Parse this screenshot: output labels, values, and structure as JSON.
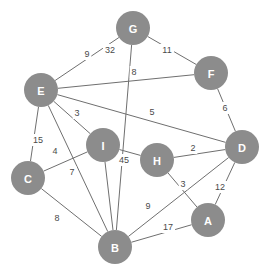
{
  "chart_data": {
    "type": "diagram",
    "subtype": "weighted-undirected-graph",
    "title": "",
    "xlabel": "",
    "ylabel": "",
    "node_radius": 17,
    "node_color": "#8c8c8c",
    "node_label_color": "#ffffff",
    "edge_color": "#6f6f6f",
    "edge_label_color": "#4a4a4a",
    "background": "#ffffff",
    "nodes": [
      {
        "id": "G",
        "label": "G",
        "x": 133,
        "y": 28
      },
      {
        "id": "F",
        "label": "F",
        "x": 211,
        "y": 73
      },
      {
        "id": "E",
        "label": "E",
        "x": 41,
        "y": 90
      },
      {
        "id": "D",
        "label": "D",
        "x": 242,
        "y": 147
      },
      {
        "id": "I",
        "label": "I",
        "x": 103,
        "y": 145
      },
      {
        "id": "H",
        "label": "H",
        "x": 157,
        "y": 160
      },
      {
        "id": "C",
        "label": "C",
        "x": 28,
        "y": 178
      },
      {
        "id": "A",
        "label": "A",
        "x": 208,
        "y": 220
      },
      {
        "id": "B",
        "label": "B",
        "x": 115,
        "y": 247
      }
    ],
    "edges": [
      {
        "source": "E",
        "target": "G",
        "weight": 9,
        "label": "9",
        "label_x": 87,
        "label_y": 54
      },
      {
        "source": "G",
        "target": "B",
        "weight": 32,
        "label": "32",
        "label_x": 110,
        "label_y": 50
      },
      {
        "source": "G",
        "target": "F",
        "weight": 11,
        "label": "11",
        "label_x": 167,
        "label_y": 50
      },
      {
        "source": "E",
        "target": "F",
        "weight": 8,
        "label": "8",
        "label_x": 134,
        "label_y": 72
      },
      {
        "source": "F",
        "target": "D",
        "weight": 6,
        "label": "6",
        "label_x": 225,
        "label_y": 108
      },
      {
        "source": "E",
        "target": "D",
        "weight": 5,
        "label": "5",
        "label_x": 152,
        "label_y": 112
      },
      {
        "source": "E",
        "target": "I",
        "weight": 3,
        "label": "3",
        "label_x": 77,
        "label_y": 113
      },
      {
        "source": "E",
        "target": "C",
        "weight": 15,
        "label": "15",
        "label_x": 38,
        "label_y": 140
      },
      {
        "source": "C",
        "target": "I",
        "weight": 4,
        "label": "4",
        "label_x": 55,
        "label_y": 151
      },
      {
        "source": "E",
        "target": "B",
        "weight": 7,
        "label": "7",
        "label_x": 72,
        "label_y": 172
      },
      {
        "source": "I",
        "target": "H",
        "weight": 45,
        "label": "45",
        "label_x": 124,
        "label_y": 160
      },
      {
        "source": "H",
        "target": "D",
        "weight": 2,
        "label": "2",
        "label_x": 193,
        "label_y": 148
      },
      {
        "source": "H",
        "target": "A",
        "weight": 3,
        "label": "3",
        "label_x": 183,
        "label_y": 184
      },
      {
        "source": "D",
        "target": "A",
        "weight": 12,
        "label": "12",
        "label_x": 220,
        "label_y": 187
      },
      {
        "source": "C",
        "target": "B",
        "weight": 8,
        "label": "8",
        "label_x": 57,
        "label_y": 218
      },
      {
        "source": "B",
        "target": "D",
        "weight": 9,
        "label": "9",
        "label_x": 148,
        "label_y": 206
      },
      {
        "source": "B",
        "target": "A",
        "weight": 17,
        "label": "17",
        "label_x": 168,
        "label_y": 227
      },
      {
        "source": "I",
        "target": "B",
        "weight": null,
        "label": "",
        "label_x": 0,
        "label_y": 0
      }
    ]
  }
}
